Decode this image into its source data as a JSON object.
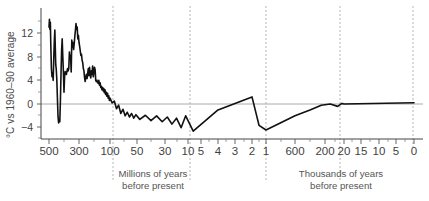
{
  "chart_data": {
    "type": "line",
    "title": "",
    "subtitle": "",
    "ylabel": "°C vs 1960–90 average",
    "xlabel_left": "Millions of years\nbefore present",
    "xlabel_right": "Thousands of years\nbefore present",
    "ylim": [
      -6,
      14.5
    ],
    "yticks": [
      12,
      8,
      4,
      0,
      -4
    ],
    "ytick_labels": [
      "12",
      "8",
      "4",
      "0",
      "−4"
    ],
    "yminor_ticks": [
      14,
      10,
      6,
      2,
      -2,
      -6
    ],
    "grid": false,
    "zero_line": true,
    "zero_line_color": "#aaaaaa",
    "legend": "none",
    "line_color": "#111111",
    "background": "#ffffff",
    "axis_color": "#444444",
    "separator_color": "#b5b5b5",
    "xtick_labels_left": [
      "500",
      "300",
      "100",
      "50",
      "30",
      "10",
      "5",
      "4",
      "3",
      "2",
      "1"
    ],
    "xtick_labels_right": [
      "600",
      "200",
      "20",
      "15",
      "10",
      "5",
      "0"
    ],
    "xtick_labels_all": [
      "500",
      "300",
      "100",
      "50",
      "30",
      "10",
      "5",
      "4",
      "3",
      "2",
      "1",
      "600",
      "200",
      "20",
      "15",
      "10",
      "5",
      "0"
    ],
    "x_axis_description": "Piecewise-compressed geological time axis, oldest (500 million years before present) at left to present (0) at right",
    "separators_description": "Five vertical dashed separators marking scale breaks of the compressed time axis",
    "series": [
      {
        "name": "Global average temperature",
        "units": "°C vs 1960–90 average",
        "points": [
          [
            500,
            13.0
          ],
          [
            497,
            14.3
          ],
          [
            494,
            12.6
          ],
          [
            491,
            13.8
          ],
          [
            488,
            10.0
          ],
          [
            484,
            6.0
          ],
          [
            480,
            4.6
          ],
          [
            476,
            5.2
          ],
          [
            472,
            4.0
          ],
          [
            468,
            8.0
          ],
          [
            464,
            11.0
          ],
          [
            461,
            12.5
          ],
          [
            458,
            9.5
          ],
          [
            455,
            6.6
          ],
          [
            452,
            6.0
          ],
          [
            448,
            4.2
          ],
          [
            444,
            1.0
          ],
          [
            440,
            -2.0
          ],
          [
            436,
            -3.2
          ],
          [
            432,
            -2.6
          ],
          [
            428,
            -3.0
          ],
          [
            424,
            0.5
          ],
          [
            420,
            5.0
          ],
          [
            416,
            9.0
          ],
          [
            412,
            11.0
          ],
          [
            408,
            8.0
          ],
          [
            404,
            5.4
          ],
          [
            400,
            2.0
          ],
          [
            396,
            4.6
          ],
          [
            392,
            5.5
          ],
          [
            388,
            5.2
          ],
          [
            384,
            5.0
          ],
          [
            380,
            5.6
          ],
          [
            376,
            6.0
          ],
          [
            372,
            5.6
          ],
          [
            368,
            6.0
          ],
          [
            364,
            8.8
          ],
          [
            360,
            7.6
          ],
          [
            356,
            8.2
          ],
          [
            352,
            5.4
          ],
          [
            348,
            10.8
          ],
          [
            344,
            9.6
          ],
          [
            340,
            10.4
          ],
          [
            336,
            9.2
          ],
          [
            332,
            10.2
          ],
          [
            328,
            11.4
          ],
          [
            324,
            12.4
          ],
          [
            320,
            13.6
          ],
          [
            316,
            12.6
          ],
          [
            312,
            13.0
          ],
          [
            308,
            11.0
          ],
          [
            304,
            11.6
          ],
          [
            300,
            10.4
          ],
          [
            296,
            9.8
          ],
          [
            292,
            9.0
          ],
          [
            288,
            8.2
          ],
          [
            284,
            8.4
          ],
          [
            280,
            7.4
          ],
          [
            276,
            7.0
          ],
          [
            272,
            6.0
          ],
          [
            268,
            5.6
          ],
          [
            264,
            4.4
          ],
          [
            260,
            3.8
          ],
          [
            256,
            4.6
          ],
          [
            252,
            5.0
          ],
          [
            248,
            4.3
          ],
          [
            244,
            5.2
          ],
          [
            240,
            6.0
          ],
          [
            236,
            4.8
          ],
          [
            232,
            6.2
          ],
          [
            228,
            5.0
          ],
          [
            224,
            4.4
          ],
          [
            220,
            5.6
          ],
          [
            216,
            5.0
          ],
          [
            212,
            6.4
          ],
          [
            208,
            4.6
          ],
          [
            204,
            5.4
          ],
          [
            200,
            6.2
          ],
          [
            196,
            5.8
          ],
          [
            192,
            4.0
          ],
          [
            188,
            3.8
          ],
          [
            184,
            4.0
          ],
          [
            180,
            3.6
          ],
          [
            176,
            3.5
          ],
          [
            172,
            4.0
          ],
          [
            168,
            3.2
          ],
          [
            164,
            3.6
          ],
          [
            160,
            2.8
          ],
          [
            156,
            3.0
          ],
          [
            152,
            2.4
          ],
          [
            148,
            2.8
          ],
          [
            144,
            2.2
          ],
          [
            140,
            2.6
          ],
          [
            136,
            1.9
          ],
          [
            132,
            2.4
          ],
          [
            128,
            1.6
          ],
          [
            124,
            2.0
          ],
          [
            120,
            1.3
          ],
          [
            116,
            1.8
          ],
          [
            112,
            1.0
          ],
          [
            108,
            1.4
          ],
          [
            104,
            0.6
          ],
          [
            100,
            1.0
          ],
          [
            96,
            0.2
          ],
          [
            92,
            0.5
          ],
          [
            88,
            -0.8
          ],
          [
            84,
            -0.2
          ],
          [
            80,
            -1.6
          ],
          [
            76,
            -0.9
          ],
          [
            72,
            -2.0
          ],
          [
            68,
            -1.4
          ],
          [
            64,
            -2.2
          ],
          [
            60,
            -1.6
          ],
          [
            56,
            -2.4
          ],
          [
            52,
            -1.8
          ],
          [
            48,
            -2.6
          ],
          [
            44,
            -1.9
          ],
          [
            40,
            -2.8
          ],
          [
            36,
            -2.0
          ],
          [
            32,
            -3.0
          ],
          [
            28,
            -2.2
          ],
          [
            24,
            -3.4
          ],
          [
            20,
            -2.4
          ],
          [
            16,
            -4.0
          ],
          [
            12,
            -2.0
          ],
          [
            8,
            -4.6
          ],
          [
            4,
            -1.0
          ],
          [
            2,
            1.2
          ],
          [
            1.5,
            -3.6
          ],
          [
            1.0,
            -4.4
          ],
          [
            0.6,
            -2.0
          ],
          [
            0.4,
            -1.0
          ],
          [
            0.25,
            -0.2
          ],
          [
            0.15,
            0.0
          ],
          [
            0.08,
            -0.4
          ],
          [
            0.04,
            0.1
          ],
          [
            0.02,
            0.0
          ],
          [
            0.0,
            0.2
          ]
        ],
        "note": "Values are read off the plotted curve; x in millions of years before present"
      }
    ],
    "key_features": [
      {
        "label": "Cambrian–Ordovician warmth",
        "value": 14.3
      },
      {
        "label": "Late Ordovician glaciation minimum",
        "value": -3.2
      },
      {
        "label": "Carboniferous/Devonian peak",
        "value": 13.6
      },
      {
        "label": "Pleistocene glacial minimum",
        "value": -4.8
      },
      {
        "label": "Present day",
        "value": 0.2
      }
    ]
  },
  "axis": {
    "ylabel": "°C vs 1960–90 average",
    "yticks": [
      "12",
      "8",
      "4",
      "0",
      "−4"
    ]
  },
  "xlabels": {
    "left": [
      "500",
      "300",
      "100",
      "50",
      "30",
      "10",
      "5",
      "4",
      "3",
      "2",
      "1"
    ],
    "right": [
      "600",
      "200",
      "20",
      "15",
      "10",
      "5",
      "0"
    ]
  },
  "captions": {
    "left_line1": "Millions of years",
    "left_line2": "before present",
    "right_line1": "Thousands of years",
    "right_line2": "before present"
  }
}
